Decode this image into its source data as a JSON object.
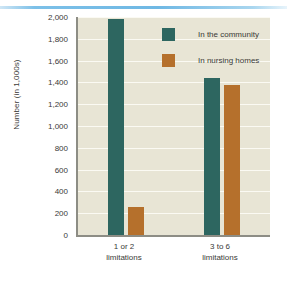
{
  "decoration": {
    "top_rule_color": "#7cc0e8"
  },
  "chart_data": {
    "type": "bar",
    "title": "",
    "xlabel": "",
    "ylabel": "Number (in 1,000s)",
    "categories": [
      "1 or 2 limitations",
      "3 to 6 limitations"
    ],
    "category_lines": [
      {
        "line1": "1 or 2",
        "line2": "limitations"
      },
      {
        "line1": "3 to 6",
        "line2": "limitations"
      }
    ],
    "series": [
      {
        "name": "In the community",
        "color": "#2d6660",
        "values": [
          1980,
          1440
        ]
      },
      {
        "name": "In nursing homes",
        "color": "#b5702c",
        "values": [
          260,
          1380
        ]
      }
    ],
    "ylim": [
      0,
      2000
    ],
    "ytick_step": 200,
    "ytick_labels": [
      "0",
      "200",
      "400",
      "600",
      "800",
      "1,000",
      "1,200",
      "1,400",
      "1,600",
      "1,800",
      "2,000"
    ],
    "ytick_values": [
      0,
      200,
      400,
      600,
      800,
      1000,
      1200,
      1400,
      1600,
      1800,
      2000
    ],
    "grid": true,
    "grid_color": "#fbfaf3",
    "plot_background": "#e8e5d5",
    "axis_color": "#8d8d85",
    "legend_position": "upper center-right inside plot"
  }
}
